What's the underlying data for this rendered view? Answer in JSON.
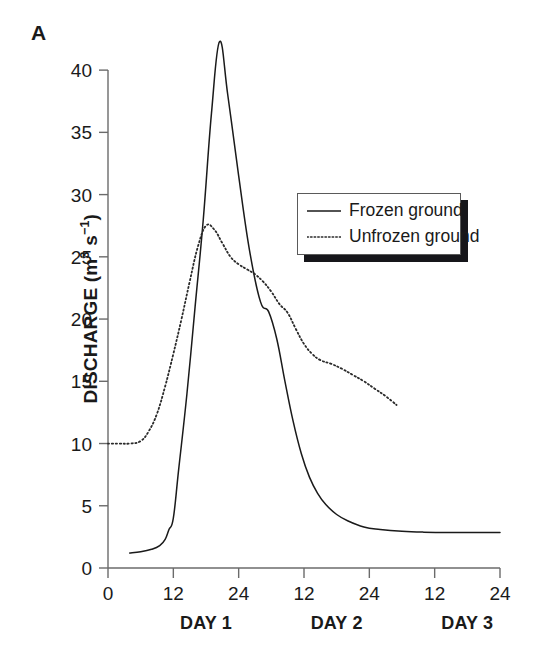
{
  "panel": {
    "label": "A"
  },
  "chart_data": {
    "type": "line",
    "title": "",
    "subtitle": "",
    "xlabel": "",
    "ylabel": "DISCHARGE (m3 s-1)",
    "ylabel_parts": {
      "main": "DISCHARGE (m",
      "sup1": "3",
      "mid": " s",
      "sup2": "−1",
      "end": ")"
    },
    "xlim": [
      0,
      72
    ],
    "ylim": [
      0,
      42.5
    ],
    "grid": false,
    "legend_position": "upper-right-inside",
    "x_unit": "hours",
    "x_tick_values": [
      0,
      12,
      24,
      36,
      48,
      60,
      72
    ],
    "x_tick_labels": [
      "0",
      "12",
      "24",
      "12",
      "24",
      "12",
      "24"
    ],
    "y_tick_values": [
      0,
      5,
      10,
      15,
      20,
      25,
      30,
      35,
      40
    ],
    "y_tick_labels": [
      "0",
      "5",
      "10",
      "15",
      "20",
      "25",
      "30",
      "35",
      "40"
    ],
    "group_labels": [
      {
        "text": "DAY 1",
        "center_x": 18
      },
      {
        "text": "DAY 2",
        "center_x": 42
      },
      {
        "text": "DAY 3",
        "center_x": 66
      }
    ],
    "series": [
      {
        "name": "Frozen ground",
        "style": "solid",
        "color": "#1a1a1a",
        "x": [
          4.0,
          6.0,
          8.0,
          9.5,
          10.5,
          11.2,
          12.0,
          13.0,
          14.5,
          16.0,
          17.5,
          19.0,
          20.5,
          22.0,
          24.0,
          26.0,
          28.0,
          29.5,
          31.0,
          32.5,
          34.0,
          35.5,
          37.0,
          38.5,
          40.0,
          42.0,
          44.0,
          47.0,
          50.0,
          54.0,
          58.0,
          63.0,
          68.0,
          72.0
        ],
        "values": [
          1.2,
          1.3,
          1.5,
          1.8,
          2.3,
          3.1,
          4.0,
          8.0,
          14.0,
          21.0,
          28.0,
          36.5,
          42.3,
          38.0,
          31.5,
          25.5,
          21.4,
          20.6,
          18.4,
          15.0,
          11.8,
          9.2,
          7.3,
          6.0,
          5.1,
          4.3,
          3.8,
          3.3,
          3.1,
          2.95,
          2.88,
          2.85,
          2.85,
          2.85
        ]
      },
      {
        "name": "Unfrozen ground",
        "style": "dotted",
        "color": "#2a2a2a",
        "x": [
          0.0,
          2.0,
          4.0,
          6.0,
          7.5,
          9.0,
          10.5,
          12.0,
          13.5,
          15.0,
          16.5,
          18.0,
          19.5,
          21.0,
          22.5,
          24.0,
          25.5,
          27.0,
          28.5,
          30.0,
          31.5,
          33.0,
          34.5,
          36.0,
          37.5,
          39.0,
          41.0,
          43.0,
          45.0,
          47.0,
          49.0,
          51.0,
          53.0
        ],
        "values": [
          10.0,
          10.0,
          10.0,
          10.2,
          11.0,
          12.4,
          14.6,
          17.2,
          20.0,
          23.0,
          25.8,
          27.5,
          27.2,
          26.1,
          25.0,
          24.4,
          24.0,
          23.6,
          23.0,
          22.2,
          21.2,
          20.5,
          19.2,
          18.0,
          17.2,
          16.7,
          16.4,
          16.0,
          15.5,
          15.0,
          14.4,
          13.8,
          13.1
        ]
      }
    ]
  },
  "legend": {
    "entries": [
      {
        "label": "Frozen ground",
        "style": "solid"
      },
      {
        "label": "Unfrozen ground",
        "style": "dotted"
      }
    ]
  },
  "colors": {
    "axis": "#6b6b6b",
    "text": "#1a1a1a",
    "frozen": "#1a1a1a",
    "unfrozen": "#2a2a2a",
    "legend_shadow": "#16161a",
    "legend_border": "#5a5a5a",
    "background": "#ffffff"
  }
}
